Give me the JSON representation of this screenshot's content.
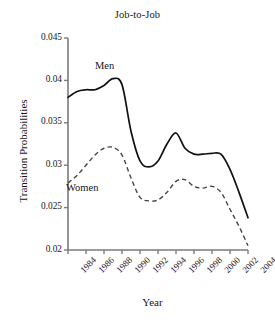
{
  "chart_data": {
    "type": "line",
    "title": "Job-to-Job",
    "xlabel": "Year",
    "ylabel": "Transition Probabilities",
    "xlim": [
      1984,
      2004
    ],
    "ylim": [
      0.02,
      0.045
    ],
    "grid": false,
    "legend_position": "inline-annotation",
    "xticks": [
      "1984",
      "1986",
      "1988",
      "1990",
      "1992",
      "1994",
      "1996",
      "1998",
      "2000",
      "2002",
      "2004"
    ],
    "yticks": [
      "0.02",
      "0.025",
      "0.03",
      "0.035",
      "0.04",
      "0.045"
    ],
    "x": [
      1984,
      1985,
      1986,
      1987,
      1988,
      1989,
      1990,
      1991,
      1992,
      1993,
      1994,
      1995,
      1996,
      1997,
      1998,
      1999,
      2000,
      2001,
      2002,
      2003,
      2004
    ],
    "series": [
      {
        "name": "Men",
        "style": "solid",
        "color": "#111111",
        "values": [
          0.038,
          0.0387,
          0.0389,
          0.0389,
          0.0394,
          0.0402,
          0.0395,
          0.034,
          0.0305,
          0.0298,
          0.0305,
          0.0325,
          0.0338,
          0.032,
          0.0313,
          0.0313,
          0.0314,
          0.0313,
          0.0295,
          0.0268,
          0.0238
        ]
      },
      {
        "name": "Women",
        "style": "dashed",
        "color": "#444444",
        "values": [
          0.0279,
          0.0288,
          0.03,
          0.0312,
          0.032,
          0.0321,
          0.0312,
          0.0285,
          0.0262,
          0.0258,
          0.0259,
          0.0268,
          0.0281,
          0.0283,
          0.0275,
          0.0273,
          0.0275,
          0.0268,
          0.0248,
          0.0228,
          0.0205
        ]
      }
    ],
    "annotations": [
      {
        "text": "Men",
        "x": 1989,
        "y": 0.0425
      },
      {
        "text": "Women",
        "x": 1986,
        "y": 0.0289
      }
    ]
  }
}
